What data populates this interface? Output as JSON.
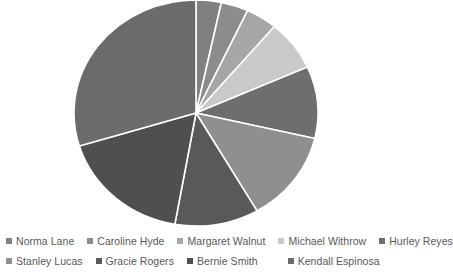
{
  "chart_data": {
    "type": "pie",
    "title": "",
    "legend_position": "bottom",
    "grid": false,
    "center": {
      "x": 196,
      "y": 113
    },
    "radius": {
      "rx": 122,
      "ry": 113
    },
    "start_angle_deg": 0,
    "direction": "clockwise",
    "categories": [
      "Norma Lane",
      "Caroline Hyde",
      "Margaret Walnut",
      "Michael Withrow",
      "Hurley Reyes",
      "Stanley Lucas",
      "Gracie Rogers",
      "Bernie Smith",
      "Kendall Espinosa"
    ],
    "values": [
      3.3,
      3.6,
      4.2,
      7.2,
      10.3,
      13.1,
      11.1,
      17.5,
      29.7
    ],
    "angles_deg": [
      12,
      13,
      15,
      26,
      37,
      47,
      40,
      63,
      107
    ],
    "colors": [
      "#808080",
      "#8c8c8c",
      "#a6a6a6",
      "#c9c9c9",
      "#6e6e6e",
      "#8f8f8f",
      "#595959",
      "#4f4f4f",
      "#6b6b6b"
    ],
    "xlabel": "",
    "ylabel": ""
  },
  "legend": {
    "rows": [
      [
        {
          "label": "Norma Lane",
          "color": "#808080",
          "icon": "legend-square-icon"
        },
        {
          "label": "Caroline Hyde",
          "color": "#8c8c8c",
          "icon": "legend-square-icon"
        },
        {
          "label": "Margaret Walnut",
          "color": "#a6a6a6",
          "icon": "legend-square-icon"
        },
        {
          "label": "Michael Withrow",
          "color": "#c9c9c9",
          "icon": "legend-square-icon"
        },
        {
          "label": "Hurley Reyes",
          "color": "#6e6e6e",
          "icon": "legend-square-icon"
        }
      ],
      [
        {
          "label": "Stanley Lucas",
          "color": "#8f8f8f",
          "icon": "legend-square-icon"
        },
        {
          "label": "Gracie Rogers",
          "color": "#595959",
          "icon": "legend-square-icon"
        },
        {
          "label": "Bernie Smith",
          "color": "#4f4f4f",
          "icon": "legend-square-icon"
        },
        {
          "label": "Kendall Espinosa",
          "color": "#6b6b6b",
          "icon": "legend-square-icon"
        }
      ]
    ]
  },
  "style": {
    "background": "#ffffff",
    "slice_border": "#ffffff",
    "slice_border_width": 1.6,
    "legend_text_color": "#595959"
  }
}
